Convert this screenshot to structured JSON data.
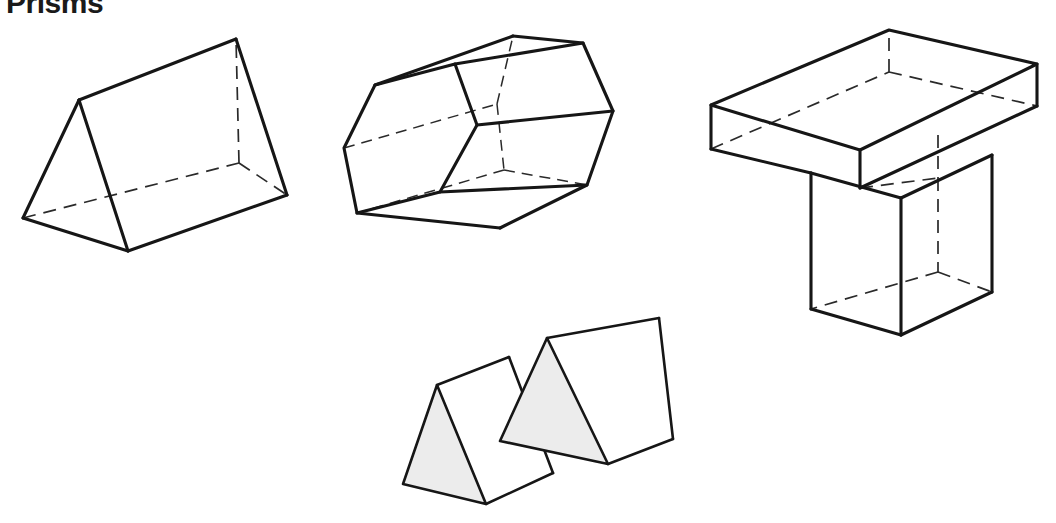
{
  "figure": {
    "title": "Prisms",
    "title_visible_partial": true,
    "background_color": "#ffffff",
    "edge_color": "#161616",
    "hidden_edge_color": "#2a2a2a",
    "shaded_face_color": "#ececec",
    "width": 1056,
    "height": 523
  },
  "shapes": [
    {
      "id": "triangular-prism",
      "name": "Triangular prism",
      "position": "top-left",
      "cross_section": "triangle",
      "shaded_faces": 0,
      "visible_faces": [
        "near-triangular-end",
        "top-rectangular-face",
        "bottom-rectangular-face"
      ],
      "hidden_edges": 3
    },
    {
      "id": "hexagonal-prism",
      "name": "Hexagonal prism",
      "position": "top-center",
      "cross_section": "hexagon",
      "shaded_faces": 0,
      "visible_faces": [
        "near-hexagonal-end",
        "upper-rectangular-face",
        "middle-rectangular-face",
        "lower-rectangular-face"
      ],
      "hidden_edges": 5
    },
    {
      "id": "t-shaped-prism",
      "name": "T-shaped prism",
      "position": "top-right",
      "cross_section": "T-shape",
      "shaded_faces": 0,
      "visible_faces": [
        "top-slab-face",
        "slab-front-face",
        "leg-front-face",
        "near-T-end"
      ],
      "hidden_edges": 8
    },
    {
      "id": "congruent-triangular-prism-left",
      "name": "Triangular prism with shaded cross section (left)",
      "position": "bottom-center-left",
      "cross_section": "triangle",
      "shaded_faces": 1,
      "visible_faces": [
        "shaded-triangular-end",
        "upper-rectangular-face",
        "lower-rectangular-face"
      ],
      "hidden_edges": 0
    },
    {
      "id": "congruent-triangular-prism-right",
      "name": "Triangular prism with shaded cross section (right)",
      "position": "bottom-center-right",
      "cross_section": "triangle",
      "shaded_faces": 1,
      "visible_faces": [
        "shaded-triangular-end",
        "upper-rectangular-face",
        "lower-rectangular-face"
      ],
      "hidden_edges": 0
    }
  ]
}
